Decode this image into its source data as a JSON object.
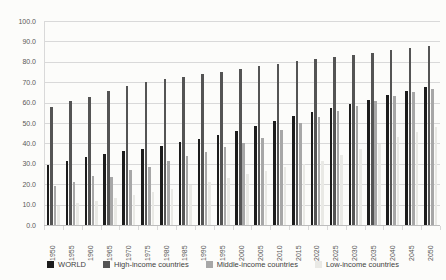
{
  "chart_data": {
    "type": "bar",
    "title": "",
    "xlabel": "",
    "ylabel": "",
    "categories": [
      "1950",
      "1955",
      "1960",
      "1965",
      "1970",
      "1975",
      "1980",
      "1985",
      "1990",
      "1995",
      "2000",
      "2005",
      "2010",
      "2015",
      "2020",
      "2025",
      "2030",
      "2035",
      "2040",
      "2045",
      "2050"
    ],
    "series": [
      {
        "name": "WORLD",
        "color": "#1c1c1c",
        "values": [
          29.4,
          31.3,
          33.3,
          34.9,
          36.2,
          37.4,
          38.9,
          40.5,
          42.3,
          44.1,
          46.1,
          48.4,
          50.8,
          53.2,
          55.5,
          57.5,
          59.5,
          61.5,
          63.8,
          65.8,
          67.6
        ]
      },
      {
        "name": "High-income countries",
        "color": "#545454",
        "values": [
          58.0,
          60.8,
          62.8,
          65.5,
          68.2,
          70.2,
          71.4,
          72.7,
          74.0,
          75.2,
          76.4,
          77.7,
          79.0,
          80.2,
          81.2,
          82.3,
          83.3,
          84.4,
          85.6,
          86.7,
          87.7
        ]
      },
      {
        "name": "Middle-income countries",
        "color": "#a7a7a7",
        "values": [
          19.0,
          21.3,
          23.9,
          23.6,
          26.8,
          28.2,
          31.2,
          33.9,
          36.0,
          38.2,
          40.3,
          42.8,
          46.6,
          49.8,
          52.7,
          55.8,
          58.4,
          60.8,
          63.2,
          65.1,
          66.9
        ]
      },
      {
        "name": "Low-income countries",
        "color": "#e9e9e5",
        "values": [
          9.4,
          10.6,
          12.0,
          13.3,
          14.6,
          16.0,
          17.6,
          19.4,
          21.3,
          23.1,
          24.9,
          26.6,
          28.3,
          30.0,
          31.6,
          34.3,
          37.1,
          39.6,
          43.0,
          45.7,
          48.2
        ]
      }
    ],
    "ylim": [
      0,
      100
    ],
    "ytick_step": 10,
    "ytick_labels": [
      "100.0",
      "90.0",
      "80.0",
      "70.0",
      "60.0",
      "50.0",
      "40.0",
      "30.0",
      "20.0",
      "10.0",
      "0.0"
    ],
    "grid": "horizontal",
    "legend_position": "bottom"
  },
  "colors": {
    "background": "#fcfcfa",
    "gridline": "#d9d9d9",
    "axis_line": "#bdbdbd",
    "tick_text": "#595959",
    "legend_text": "#3f3f3f"
  }
}
